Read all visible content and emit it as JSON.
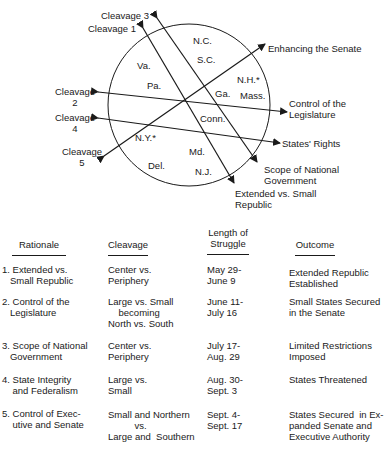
{
  "diagram": {
    "cleavage_labels": {
      "c1": "Cleavage 1",
      "c2_line1": "Cleavage",
      "c2_line2": "2",
      "c3": "Cleavage 3",
      "c4_line1": "Cleavage",
      "c4_line2": "4",
      "c5_line1": "Cleavage",
      "c5_line2": "5"
    },
    "rationale_labels": {
      "enhancing_senate": "Enhancing the Senate",
      "control_legislature_line1": "Control of the",
      "control_legislature_line2": "Legislature",
      "states_rights": "States' Rights",
      "scope_line1": "Scope of National",
      "scope_line2": "Government",
      "extended_line1": "Extended vs. Small",
      "extended_line2": "Republic"
    },
    "states": {
      "nc": "N.C.",
      "sc": "S.C.",
      "va": "Va.",
      "pa": "Pa.",
      "nh": "N.H.*",
      "ga": "Ga.",
      "mass": "Mass.",
      "conn": "Conn.",
      "ny": "N.Y.*",
      "md": "Md.",
      "del": "Del.",
      "nj": "N.J."
    },
    "line_color": "#1a1a1a"
  },
  "table": {
    "headers": {
      "rationale": "Rationale",
      "cleavage": "Cleavage",
      "length_line1": "Length of",
      "length_line2": "Struggle",
      "outcome": "Outcome"
    },
    "rows": [
      {
        "rationale": "1. Extended vs.\n   Small Republic",
        "cleavage": "Center vs.\nPeriphery",
        "length": "May 29-\nJune 9",
        "outcome": "Extended Republic\nEstablished"
      },
      {
        "rationale": "2. Control of the\n   Legislature",
        "cleavage": "Large vs. Small\n    becoming\nNorth vs. South",
        "length": "June 11-\nJuly 16",
        "outcome": "Small States Secured\nin the Senate"
      },
      {
        "rationale": "3. Scope of National\n   Government",
        "cleavage": "Center vs.\nPeriphery",
        "length": "July 17-\nAug. 29",
        "outcome": "Limited Restrictions\nImposed"
      },
      {
        "rationale": "4. State Integrity\n    and Federalism",
        "cleavage": "Large vs.\nSmall",
        "length": "Aug. 30-\nSept. 3",
        "outcome": "States Threatened"
      },
      {
        "rationale": "5. Control of Exec-\n    utive and Senate",
        "cleavage": "Small and Northern\n          vs.\nLarge and  Southern",
        "length": "Sept. 4-\nSept. 17",
        "outcome": "States Secured  in Ex-\npanded Senate and\nExecutive Authority"
      }
    ]
  }
}
